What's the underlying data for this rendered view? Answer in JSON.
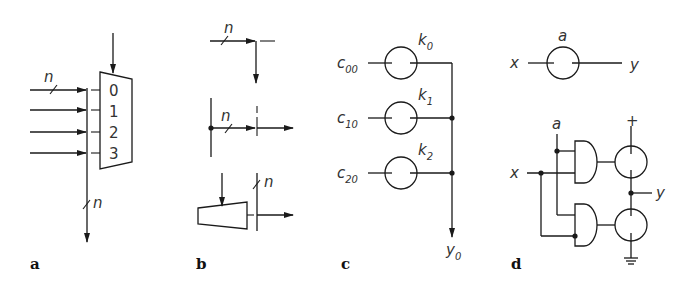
{
  "figure": {
    "panels": [
      {
        "id": "a",
        "label": "a",
        "description": "4-to-1 multiplexer with n-bit bus inputs",
        "input_bus_width": "n",
        "output_bus_width": "n",
        "mux_inputs": [
          "0",
          "1",
          "2",
          "3"
        ]
      },
      {
        "id": "b",
        "label": "b",
        "description": "Bus junction notations",
        "bus_width_top": "n",
        "bus_width_middle": "n",
        "bus_width_bottom": "n"
      },
      {
        "id": "c",
        "label": "c",
        "description": "Switch-based selection network",
        "inputs": [
          {
            "base": "c",
            "sub": "00",
            "switch_base": "k",
            "switch_sub": "0"
          },
          {
            "base": "c",
            "sub": "10",
            "switch_base": "k",
            "switch_sub": "1"
          },
          {
            "base": "c",
            "sub": "20",
            "switch_base": "k",
            "switch_sub": "2"
          }
        ],
        "output": {
          "base": "y",
          "sub": "0"
        }
      },
      {
        "id": "d",
        "label": "d",
        "description": "Switch symbol and its gate-level realization",
        "switch": {
          "input": "x",
          "control": "a",
          "output": "y"
        },
        "circuit": {
          "control": "a",
          "input": "x",
          "output": "y",
          "supply": "+",
          "ground": "ground-symbol"
        }
      }
    ]
  }
}
